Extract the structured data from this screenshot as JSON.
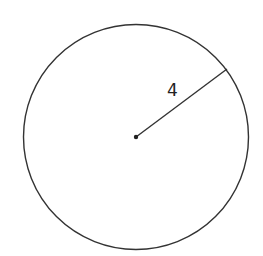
{
  "diagram": {
    "type": "circle-radius",
    "center": {
      "x": 136,
      "y": 137
    },
    "radius_px": 112,
    "radius_endpoint": {
      "x": 227,
      "y": 69
    },
    "radius_label": "4",
    "stroke_color": "#333333",
    "background": "#ffffff"
  }
}
